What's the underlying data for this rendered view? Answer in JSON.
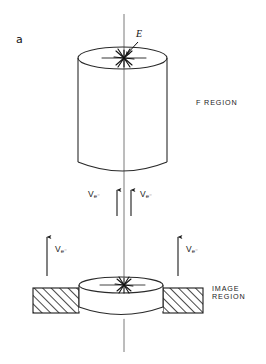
{
  "figure": {
    "panel_label": "a",
    "type": "technical-line-diagram",
    "background_color": "#ffffff",
    "line_color": "#1a1a1a"
  },
  "labels": {
    "panel": "a",
    "source_label": "E",
    "f_region": "F REGION",
    "image_region_line1": "IMAGE",
    "image_region_line2": "REGION",
    "velocity_symbol": "V",
    "velocity_subscript": "e⁻"
  },
  "arrows": {
    "downward": [
      {
        "id": "down-left",
        "x": 117,
        "y_start": 190,
        "y_end": 219,
        "direction": "down"
      },
      {
        "id": "down-right",
        "x": 131,
        "y_start": 190,
        "y_end": 219,
        "direction": "down"
      }
    ],
    "upward": [
      {
        "id": "up-left",
        "x": 47,
        "y_start": 276,
        "y_end": 234,
        "direction": "up"
      },
      {
        "id": "up-right",
        "x": 178,
        "y_start": 276,
        "y_end": 234,
        "direction": "up"
      }
    ],
    "label_text": "Ve-"
  },
  "geometry": {
    "axis": {
      "x": 124,
      "y_top": 14,
      "y_bottom": 352
    },
    "upper_cylinder": {
      "left": 78,
      "right": 167,
      "top_ellipse_cy": 58,
      "bottom_cy": 168,
      "ellipse_ry": 11
    },
    "lower_disc": {
      "left": 79,
      "right": 163,
      "top_ellipse_cy": 285,
      "bottom_cy": 311,
      "ellipse_ry": 8
    },
    "hatched_bar": {
      "left": 33,
      "right": 203,
      "top": 288,
      "bottom": 313
    }
  },
  "markers": {
    "burst_top": {
      "x": 124,
      "y": 58,
      "name": "explosion-burst"
    },
    "burst_bottom": {
      "x": 124,
      "y": 285,
      "name": "explosion-burst"
    }
  }
}
